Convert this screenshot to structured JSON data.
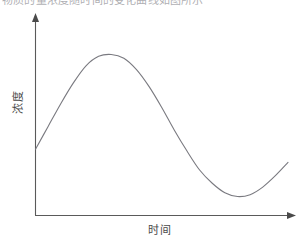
{
  "figure": {
    "top_caption": "物质的量浓度随时间的变化曲线如图所示",
    "x_axis_label": "时间",
    "y_axis_label": "浓度",
    "axis_color": "#5a5a5a",
    "curve_color": "#7a7a80",
    "background_color": "#ffffff"
  },
  "chart_data": {
    "type": "line",
    "title": "",
    "subtitle": "",
    "xlabel": "时间",
    "ylabel": "浓度",
    "xlim": [
      0,
      10
    ],
    "ylim": [
      0,
      10
    ],
    "grid": false,
    "legend": null,
    "legend_position": "none",
    "axis_ticks": {
      "x": [],
      "y": []
    },
    "annotations": [],
    "series": [
      {
        "name": "浓度",
        "x": [
          0.0,
          0.5,
          1.0,
          1.5,
          2.0,
          2.5,
          3.0,
          3.5,
          4.0,
          4.5,
          5.0,
          5.5,
          6.0,
          6.5,
          7.0,
          7.5,
          8.0,
          8.5,
          9.0,
          9.5,
          10.0
        ],
        "y": [
          3.5,
          4.7,
          5.9,
          7.0,
          7.9,
          8.4,
          8.5,
          8.3,
          7.7,
          6.8,
          5.7,
          4.5,
          3.4,
          2.4,
          1.7,
          1.2,
          1.0,
          1.1,
          1.5,
          2.1,
          2.8
        ]
      }
    ],
    "features": {
      "start_value": 3.5,
      "peak": {
        "x": 3.0,
        "y": 8.5
      },
      "trough": {
        "x": 8.0,
        "y": 1.0
      },
      "end_value": 2.8
    }
  }
}
